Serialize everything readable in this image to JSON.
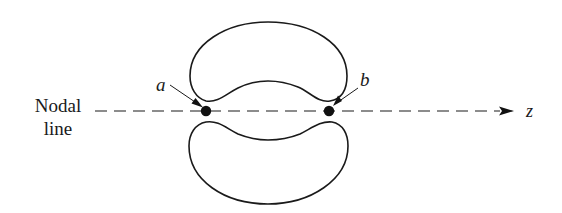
{
  "diagram": {
    "title": "",
    "labels": {
      "nodal_line_line1": "Nodal",
      "nodal_line_line2": "line",
      "point_a": "a",
      "point_b": "b",
      "axis": "z"
    },
    "elements": {
      "upper_lobe": "kidney-shaped closed curve above the nodal line",
      "lower_lobe": "kidney-shaped closed curve below the nodal line",
      "nodal_line": "dashed horizontal line with arrow pointing to z",
      "point_a": "filled dot on nodal line, left",
      "point_b": "filled dot on nodal line, right"
    },
    "colors": {
      "stroke": "#1a1a1a",
      "background": "#ffffff"
    }
  }
}
